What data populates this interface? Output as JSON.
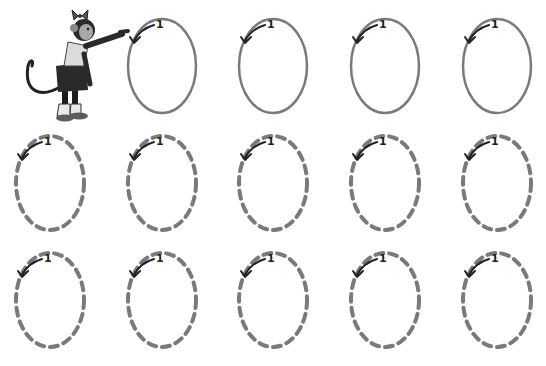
{
  "worksheet": {
    "activity": "trace-the-oval",
    "start_number": "1",
    "colors": {
      "background": "#ffffff",
      "solid_oval": "#7a7a7a",
      "dashed_oval": "#7a7a7a",
      "arrow": "#222222"
    },
    "rows": [
      {
        "style": "solid",
        "cells": [
          {
            "cx": 162,
            "cy": 66,
            "label": "1"
          },
          {
            "cx": 273,
            "cy": 66,
            "label": "1"
          },
          {
            "cx": 385,
            "cy": 66,
            "label": "1"
          },
          {
            "cx": 497,
            "cy": 66,
            "label": "1"
          }
        ]
      },
      {
        "style": "dashed",
        "cells": [
          {
            "cx": 50,
            "cy": 183,
            "label": "1"
          },
          {
            "cx": 162,
            "cy": 183,
            "label": "1"
          },
          {
            "cx": 273,
            "cy": 183,
            "label": "1"
          },
          {
            "cx": 385,
            "cy": 183,
            "label": "1"
          },
          {
            "cx": 497,
            "cy": 183,
            "label": "1"
          }
        ]
      },
      {
        "style": "dashed",
        "cells": [
          {
            "cx": 50,
            "cy": 300,
            "label": "1"
          },
          {
            "cx": 162,
            "cy": 300,
            "label": "1"
          },
          {
            "cx": 273,
            "cy": 300,
            "label": "1"
          },
          {
            "cx": 385,
            "cy": 300,
            "label": "1"
          },
          {
            "cx": 497,
            "cy": 300,
            "label": "1"
          }
        ]
      }
    ]
  },
  "character": {
    "icon": "monkey-girl-pointing-icon"
  }
}
